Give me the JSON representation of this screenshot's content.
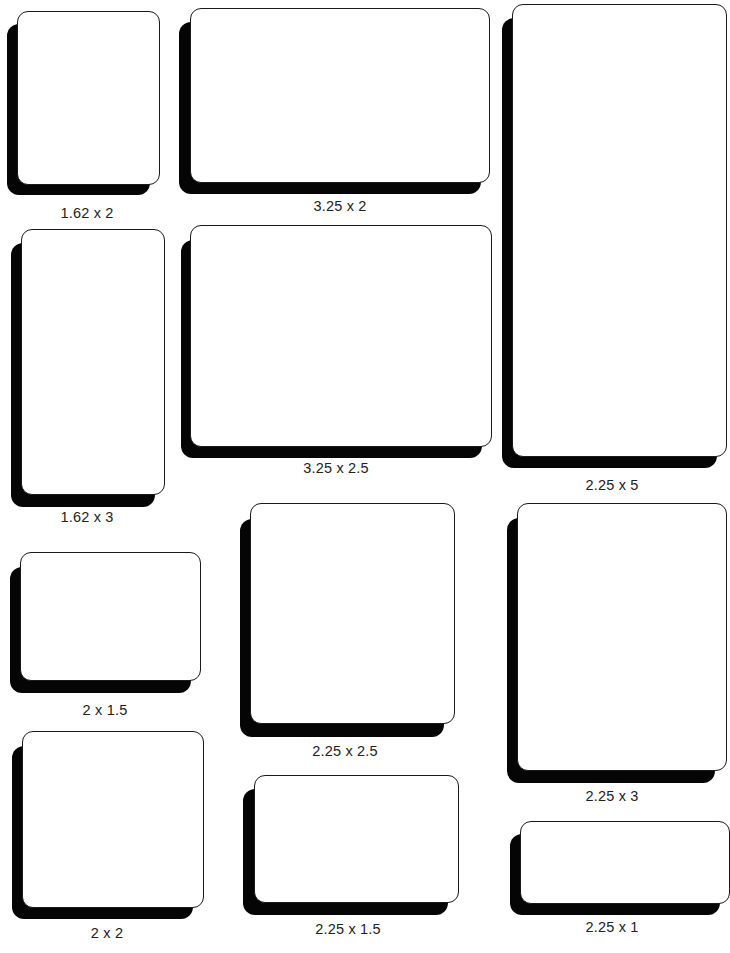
{
  "colors": {
    "background": "#ffffff",
    "shadow": "#050505",
    "card": "#ffffff",
    "border": "#1a1a1a",
    "text": "#222222"
  },
  "cards": [
    {
      "id": "1.62x2",
      "label": "1.62 x 2",
      "width_in": 1.62,
      "height_in": 2,
      "face": [
        17,
        11,
        143,
        174
      ],
      "shadow": [
        7,
        24,
        143,
        171
      ],
      "labelPos": [
        17,
        207,
        143
      ]
    },
    {
      "id": "3.25x2",
      "label": "3.25 x 2",
      "width_in": 3.25,
      "height_in": 2,
      "face": [
        190,
        8,
        300,
        175
      ],
      "shadow": [
        179,
        22,
        302,
        172
      ],
      "labelPos": [
        190,
        200,
        300
      ]
    },
    {
      "id": "2.25x5",
      "label": "2.25 x 5",
      "width_in": 2.25,
      "height_in": 5,
      "face": [
        512,
        4,
        210,
        453
      ],
      "shadow": [
        502,
        18,
        210,
        450
      ],
      "labelPos": [
        512,
        478,
        210
      ]
    },
    {
      "id": "1.62x3",
      "label": "1.62 x 3",
      "width_in": 1.62,
      "height_in": 3,
      "face": [
        21,
        229,
        144,
        266
      ],
      "shadow": [
        11,
        243,
        144,
        264
      ],
      "labelPos": [
        15,
        510,
        140
      ]
    },
    {
      "id": "3.25x2.5",
      "label": "3.25 x 2.5",
      "width_in": 3.25,
      "height_in": 2.5,
      "face": [
        190,
        225,
        302,
        222
      ],
      "shadow": [
        181,
        240,
        301,
        218
      ],
      "labelPos": [
        181,
        462,
        310
      ]
    },
    {
      "id": "2x1.5",
      "label": "2 x 1.5",
      "width_in": 2,
      "height_in": 1.5,
      "face": [
        20,
        552,
        181,
        129
      ],
      "shadow": [
        10,
        567,
        181,
        126
      ],
      "labelPos": [
        15,
        703,
        180
      ]
    },
    {
      "id": "2.25x2.5",
      "label": "2.25 x 2.5",
      "width_in": 2.25,
      "height_in": 2.5,
      "face": [
        250,
        503,
        205,
        221
      ],
      "shadow": [
        240,
        519,
        204,
        218
      ],
      "labelPos": [
        240,
        744,
        215
      ]
    },
    {
      "id": "2.25x3",
      "label": "2.25 x 3",
      "width_in": 2.25,
      "height_in": 3,
      "face": [
        517,
        503,
        205,
        268
      ],
      "shadow": [
        507,
        518,
        205,
        265
      ],
      "labelPos": [
        512,
        789,
        200
      ]
    },
    {
      "id": "2x2",
      "label": "2 x 2",
      "width_in": 2,
      "height_in": 2,
      "face": [
        22,
        731,
        182,
        177
      ],
      "shadow": [
        12,
        746,
        181,
        173
      ],
      "labelPos": [
        15,
        926,
        190
      ]
    },
    {
      "id": "2.25x1.5",
      "label": "2.25 x 1.5",
      "width_in": 2.25,
      "height_in": 1.5,
      "face": [
        254,
        775,
        205,
        128
      ],
      "shadow": [
        243,
        789,
        205,
        126
      ],
      "labelPos": [
        243,
        922,
        215
      ]
    },
    {
      "id": "2.25x1",
      "label": "2.25 x 1",
      "width_in": 2.25,
      "height_in": 1,
      "face": [
        520,
        821,
        205,
        83
      ],
      "shadow": [
        510,
        834,
        205,
        81
      ],
      "labelPos": [
        512,
        920,
        200
      ]
    }
  ]
}
